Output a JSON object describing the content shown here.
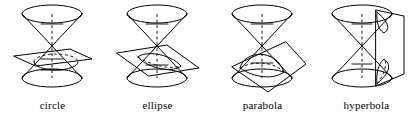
{
  "figure": {
    "background_color": "#ffffff",
    "stroke_color": "#000000",
    "panel_count": 4
  },
  "panels": [
    {
      "id": "circle",
      "label": "circle",
      "icon_name": "double-cone-horizontal-plane-diagram",
      "plane_orientation": "horizontal",
      "plane_shape": "parallelogram",
      "nappes_cut": 1,
      "description": "Horizontal plane perpendicular to the cone axis cutting the lower nappe"
    },
    {
      "id": "ellipse",
      "label": "ellipse",
      "icon_name": "double-cone-tilted-plane-diagram",
      "plane_orientation": "tilted-shallow",
      "plane_shape": "parallelogram",
      "nappes_cut": 1,
      "description": "Plane tilted at an angle less than the cone side slope cutting the lower nappe"
    },
    {
      "id": "parabola",
      "label": "parabola",
      "icon_name": "double-cone-parallel-plane-diagram",
      "plane_orientation": "tilted-parallel-to-side",
      "plane_shape": "diamond",
      "nappes_cut": 1,
      "description": "Plane parallel to a generating line of the cone cutting the lower nappe"
    },
    {
      "id": "hyperbola",
      "label": "hyperbola",
      "icon_name": "double-cone-vertical-plane-diagram",
      "plane_orientation": "vertical",
      "plane_shape": "rectangle",
      "nappes_cut": 2,
      "description": "Vertical plane parallel to the cone axis cutting both nappes"
    }
  ]
}
